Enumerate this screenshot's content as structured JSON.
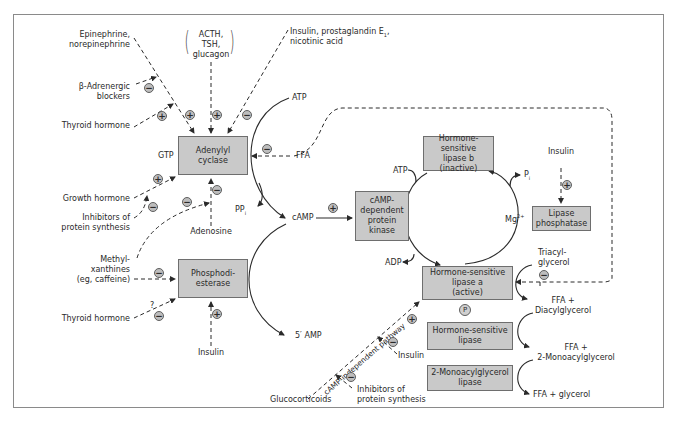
{
  "boxes": {
    "adenylyl_cyclase": "Adenylyl\ncyclase",
    "phosphodiesterase": "Phosphodi-\nesterase",
    "camp_kinase": "cAMP-\ndependent\nprotein\nkinase",
    "hsl_b": "Hormone-sensitive\nlipase b\n(inactive)",
    "lipase_phosphatase": "Lipase\nphosphatase",
    "hsl_a": "Hormone-sensitive\nlipase a\n(active)",
    "hsl": "Hormone-sensitive\nlipase",
    "mag_lipase": "2-Monoacylglycerol\nlipase"
  },
  "labels": {
    "epinephrine": "Epinephrine,\nnorepinephrine",
    "acth": "ACTH,\nTSH,\nglucagon",
    "insulin_pge": "Insulin, prostaglandin E",
    "insulin_pge_sub": "1",
    "insulin_pge_2": ",",
    "nicotinic": "nicotinic acid",
    "beta_blockers": "β-Adrenergic\nblockers",
    "thyroid_top": "Thyroid hormone",
    "atp_top": "ATP",
    "gtp": "GTP",
    "ffa_top": "FFA",
    "growth_hormone": "Growth hormone",
    "inhib_protein_left": "Inhibitors of\nprotein synthesis",
    "adenosine": "Adenosine",
    "ppi": "PP",
    "ppi_sub": "i",
    "camp": "cAMP",
    "methylxanthines": "Methyl-\nxanthines\n(eg, caffeine)",
    "question": "?",
    "thyroid_bottom": "Thyroid hormone",
    "insulin_pde": "Insulin",
    "five_amp": "5′ AMP",
    "glucocorticoids": "Glucocorticoids",
    "inhib_protein_right": "Inhibitors of\nprotein synthesis",
    "insulin_hsl": "Insulin",
    "camp_independent": "cAMP-independent pathway",
    "atp_cycle": "ATP",
    "adp_cycle": "ADP",
    "pi": "P",
    "pi_sub": "i",
    "mg": "Mg",
    "mg_sup": "2+",
    "insulin_phosphatase": "Insulin",
    "triacylglycerol": "Triacyl-\nglycerol",
    "ffa_dag": "FFA +\nDiacylglycerol",
    "ffa_mag": "FFA +\n2-Monoacylglycerol",
    "ffa_glycerol": "FFA + glycerol",
    "phospho": "P"
  },
  "signs": {
    "plus": "+",
    "minus": "−"
  },
  "colors": {
    "box_fill": "#c9c9c9",
    "box_border": "#6e6e6e",
    "line": "#2a2a2a",
    "frame": "#8a8a8a"
  }
}
